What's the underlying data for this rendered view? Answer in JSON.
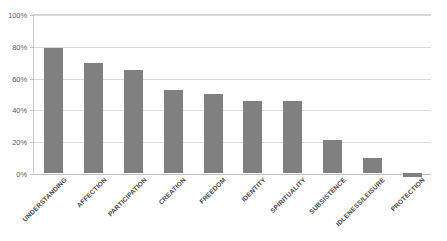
{
  "chart_data": {
    "type": "bar",
    "title": "",
    "subtitle": "",
    "xlabel": "",
    "ylabel": "",
    "categories": [
      "UNDERSTANDING",
      "AFFECTION",
      "PARTICIPATION",
      "CREATION",
      "FREEDOM",
      "IDENTITY",
      "SPIRITUALITY",
      "SUBSISTENCE",
      "IDLENESS/LEISURE",
      "PROTECTION"
    ],
    "values": [
      78.5,
      69,
      64.5,
      52,
      49.5,
      45,
      45,
      21,
      9.5,
      -2.5
    ],
    "value_labels": [
      "78.5%",
      "69%",
      "64.5%",
      "52%",
      "49.5%",
      "45%",
      "45%",
      "21%",
      "9.5%",
      "-2.5%"
    ],
    "ylim": [
      0,
      100
    ],
    "yticks": [
      0,
      20,
      40,
      60,
      80,
      100
    ],
    "ytick_labels": [
      "0%",
      "20%",
      "40%",
      "60%",
      "80%",
      "100%"
    ],
    "grid": true,
    "legend": false,
    "legend_position": "none",
    "series": [
      {
        "name": "",
        "color": "#808080",
        "values": [
          78.5,
          69,
          64.5,
          52,
          49.5,
          45,
          45,
          21,
          9.5,
          -2.5
        ]
      }
    ],
    "colors": {
      "bar": "#808080",
      "gridline": "#d9d9d9",
      "axis": "#bdbdbd",
      "background": "#ffffff",
      "text": "#4a4a4a"
    }
  }
}
